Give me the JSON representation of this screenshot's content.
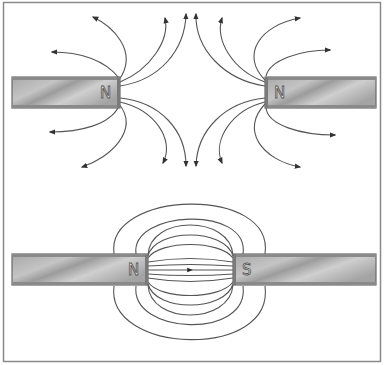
{
  "diagram": {
    "top": {
      "description": "Two like poles (N facing N) repel",
      "left_magnet_label": "N",
      "right_magnet_label": "N"
    },
    "bottom": {
      "description": "Opposite poles (N facing S) attract",
      "left_magnet_label": "N",
      "right_magnet_label": "S"
    }
  },
  "colors": {
    "frame": "#8a8a8a",
    "magnet_fill": "#b0b0b0",
    "magnet_edge": "#6a6a6a",
    "field_line": "#444444"
  }
}
